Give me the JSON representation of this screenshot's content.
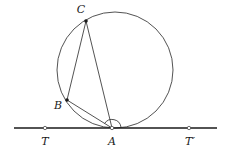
{
  "figure": {
    "background_color": "#ffffff",
    "stroke_color": "#3f3f3f",
    "tangent_line_color": "#1a1a1a",
    "label_color": "#1a1a1a",
    "point_fill_color": "#1a1a1a"
  },
  "circle": {
    "name": "main-circle",
    "cx": 115,
    "cy": 70,
    "r": 58,
    "stroke_width": 0.9
  },
  "tangent_line": {
    "name": "tangent-line-TT-prime",
    "x1": 14,
    "x2": 217,
    "y": 128,
    "stroke_width": 1.6
  },
  "points": [
    {
      "id": "C",
      "label": "C",
      "x": 86,
      "y": 21,
      "label_x": 81,
      "label_y": 9,
      "marker": "filled-dot",
      "marker_r": 1.8
    },
    {
      "id": "B",
      "label": "B",
      "x": 67,
      "y": 100,
      "label_x": 58,
      "label_y": 105,
      "marker": "filled-dot",
      "marker_r": 1.8
    },
    {
      "id": "A",
      "label": "A",
      "x": 112,
      "y": 128,
      "label_x": 112,
      "label_y": 141,
      "marker": "open-dot",
      "marker_r": 1.7
    },
    {
      "id": "T",
      "label": "T",
      "x": 45,
      "y": 128,
      "label_x": 45,
      "label_y": 141,
      "marker": "open-dot",
      "marker_r": 1.7
    },
    {
      "id": "Tprime",
      "label": "T′",
      "x": 189,
      "y": 128,
      "label_x": 190,
      "label_y": 141,
      "marker": "open-dot",
      "marker_r": 1.7
    }
  ],
  "segments": [
    {
      "name": "segment-CB",
      "from": "C",
      "to": "B",
      "x1": 86,
      "y1": 21,
      "x2": 67,
      "y2": 100
    },
    {
      "name": "segment-CA",
      "from": "C",
      "to": "A",
      "x1": 86,
      "y1": 21,
      "x2": 112,
      "y2": 128
    },
    {
      "name": "segment-BA",
      "from": "B",
      "to": "A",
      "x1": 67,
      "y1": 100,
      "x2": 112,
      "y2": 128
    }
  ],
  "angle_marker": {
    "name": "angle-arc-at-A",
    "vertex": "A",
    "path": "M 104.5 123.6 A 9 9 0 0 1 121 127.2",
    "stroke_width": 0.9,
    "description": "arc marking the tangent-chord angle at A"
  }
}
